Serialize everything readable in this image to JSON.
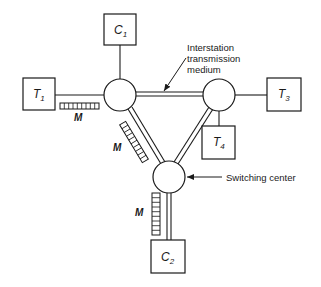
{
  "diagram": {
    "colors": {
      "ink": "#1a1a1a",
      "background": "#ffffff"
    },
    "terminals": [
      {
        "id": "T1",
        "letter": "T",
        "sub": "1"
      },
      {
        "id": "T3",
        "letter": "T",
        "sub": "3"
      },
      {
        "id": "T4",
        "letter": "T",
        "sub": "4"
      }
    ],
    "concentrators": [
      {
        "id": "C1",
        "letter": "C",
        "sub": "1"
      },
      {
        "id": "C2",
        "letter": "C",
        "sub": "2"
      }
    ],
    "multiplexer_labels": [
      {
        "text": "M"
      },
      {
        "text": "M"
      },
      {
        "text": "M"
      }
    ],
    "annotations": {
      "medium_line1": "Interstation",
      "medium_line2": "transmission",
      "medium_line3": "medium",
      "switching_center": "Switching center"
    }
  }
}
